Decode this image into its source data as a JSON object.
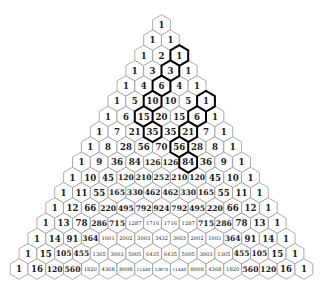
{
  "diagram": {
    "layout": {
      "apex_center_x": 161.5,
      "apex_center_y": 25,
      "hex_width": 17.8,
      "row_pitch": 15.25
    },
    "colors": {
      "background": "#ffffff",
      "cell_stroke": "#8a8a8a",
      "highlight_stroke": "#000000",
      "text": "#1a1a1a"
    },
    "rows": [
      [
        1
      ],
      [
        1,
        1
      ],
      [
        1,
        2,
        1
      ],
      [
        1,
        3,
        3,
        1
      ],
      [
        1,
        4,
        6,
        4,
        1
      ],
      [
        1,
        5,
        10,
        10,
        5,
        1
      ],
      [
        1,
        6,
        15,
        20,
        15,
        6,
        1
      ],
      [
        1,
        7,
        21,
        35,
        35,
        21,
        7,
        1
      ],
      [
        1,
        8,
        28,
        56,
        70,
        56,
        28,
        8,
        1
      ],
      [
        1,
        9,
        36,
        84,
        126,
        126,
        84,
        36,
        9,
        1
      ],
      [
        1,
        10,
        45,
        120,
        210,
        252,
        210,
        120,
        45,
        10,
        1
      ],
      [
        1,
        11,
        55,
        165,
        330,
        462,
        462,
        330,
        165,
        55,
        11,
        1
      ],
      [
        1,
        12,
        66,
        220,
        495,
        792,
        924,
        792,
        495,
        220,
        66,
        12,
        1
      ],
      [
        1,
        13,
        78,
        286,
        715,
        1287,
        1716,
        1716,
        1287,
        715,
        286,
        78,
        13,
        1
      ],
      [
        1,
        14,
        91,
        364,
        1001,
        2002,
        3003,
        3432,
        3003,
        2002,
        1001,
        364,
        91,
        14,
        1
      ],
      [
        1,
        15,
        105,
        455,
        1365,
        3003,
        5005,
        6435,
        6435,
        5005,
        3003,
        1365,
        455,
        105,
        15,
        1
      ],
      [
        1,
        16,
        120,
        560,
        1820,
        4368,
        8008,
        11440,
        12870,
        11440,
        8008,
        4368,
        1820,
        560,
        120,
        16,
        1
      ]
    ],
    "highlighted_cells": [
      {
        "row": 2,
        "index": 2,
        "value": 1
      },
      {
        "row": 3,
        "index": 2,
        "value": 3
      },
      {
        "row": 4,
        "index": 2,
        "value": 6
      },
      {
        "row": 5,
        "index": 2,
        "value": 10
      },
      {
        "row": 6,
        "index": 2,
        "value": 15
      },
      {
        "row": 7,
        "index": 3,
        "value": 35
      },
      {
        "row": 5,
        "index": 5,
        "value": 1
      },
      {
        "row": 6,
        "index": 5,
        "value": 6
      },
      {
        "row": 7,
        "index": 5,
        "value": 21
      },
      {
        "row": 8,
        "index": 5,
        "value": 56
      },
      {
        "row": 9,
        "index": 6,
        "value": 84
      }
    ]
  }
}
